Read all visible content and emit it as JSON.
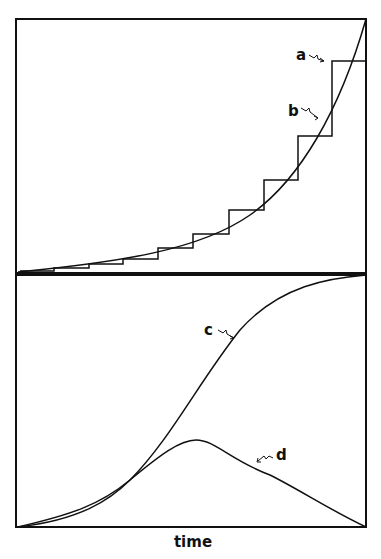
{
  "figure": {
    "panels": [
      {
        "id": "top",
        "curves": [
          {
            "label": "a",
            "description": "step function approximation"
          },
          {
            "label": "b",
            "description": "exponential growth curve"
          }
        ]
      },
      {
        "id": "bottom",
        "curves": [
          {
            "label": "c",
            "description": "sigmoid (logistic) curve"
          },
          {
            "label": "d",
            "description": "bell-shaped rate curve"
          }
        ]
      }
    ],
    "labels": {
      "a": "a",
      "b": "b",
      "c": "c",
      "d": "d"
    },
    "x_axis_label": "time",
    "colors": {
      "line": "#111111",
      "background": "#ffffff"
    }
  }
}
